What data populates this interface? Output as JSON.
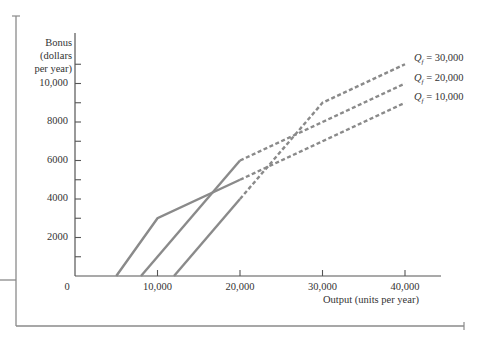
{
  "chart_data": {
    "type": "line",
    "title": "",
    "xlabel": "Output (units per year)",
    "ylabel": "Bonus (dollars per year)",
    "ylabel_lines": [
      "Bonus",
      "(dollars",
      "per year)"
    ],
    "xlim": [
      0,
      44000
    ],
    "ylim": [
      0,
      11000
    ],
    "grid": false,
    "x_ticks": [
      {
        "value": 0,
        "label": "0"
      },
      {
        "value": 10000,
        "label": "10,000"
      },
      {
        "value": 20000,
        "label": "20,000"
      },
      {
        "value": 30000,
        "label": "30,000"
      },
      {
        "value": 40000,
        "label": "40,000"
      }
    ],
    "y_ticks": [
      {
        "value": 2000,
        "label": "2000"
      },
      {
        "value": 4000,
        "label": "4000"
      },
      {
        "value": 6000,
        "label": "6000"
      },
      {
        "value": 8000,
        "label": "8000"
      },
      {
        "value": 10000,
        "label": "10,000"
      }
    ],
    "y_minor_ticks": [
      1000,
      3000,
      5000,
      7000,
      9000,
      11000
    ],
    "series": [
      {
        "name": "Qf = 10,000",
        "label_var": "Q",
        "label_sub": "f",
        "label_value": "= 10,000",
        "solid": [
          {
            "x": 5000,
            "y": 0
          },
          {
            "x": 10000,
            "y": 3000
          },
          {
            "x": 20000,
            "y": 5000
          }
        ],
        "dashed": [
          {
            "x": 20000,
            "y": 5000
          },
          {
            "x": 40000,
            "y": 9000
          }
        ]
      },
      {
        "name": "Qf = 20,000",
        "label_var": "Q",
        "label_sub": "f",
        "label_value": "= 20,000",
        "solid": [
          {
            "x": 8000,
            "y": 0
          },
          {
            "x": 20000,
            "y": 6000
          }
        ],
        "dashed": [
          {
            "x": 20000,
            "y": 6000
          },
          {
            "x": 40000,
            "y": 10000
          }
        ]
      },
      {
        "name": "Qf = 30,000",
        "label_var": "Q",
        "label_sub": "f",
        "label_value": "= 30,000",
        "solid": [
          {
            "x": 12000,
            "y": 0
          },
          {
            "x": 20000,
            "y": 4000
          }
        ],
        "dashed": [
          {
            "x": 20000,
            "y": 4000
          },
          {
            "x": 30000,
            "y": 9000
          },
          {
            "x": 40000,
            "y": 11000
          }
        ]
      }
    ],
    "line_color": "#8a8a8a",
    "axis_color": "#555555",
    "legend_position": "right, at end of each line"
  }
}
